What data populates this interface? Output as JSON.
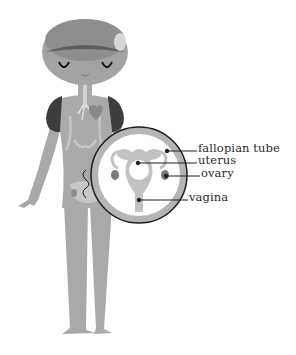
{
  "diagram": {
    "figure": "cartoon human figure with magnified inset of reproductive organs",
    "labels": [
      {
        "id": "fallopian_tube",
        "text": "fallopian tube"
      },
      {
        "id": "uterus",
        "text": "uterus"
      },
      {
        "id": "ovary",
        "text": "ovary"
      },
      {
        "id": "vagina",
        "text": "vagina"
      }
    ],
    "colors": {
      "body": "#a9a9a9",
      "body_light": "#c7c7c7",
      "head_dark": "#8e8e8e",
      "lungs": "#3d3d3d",
      "inset_ring": "#b5b5b5",
      "inset_bg": "#ffffff",
      "organ": "#c2c2c2",
      "ovary": "#7a7a7a",
      "line": "#1e1e1e"
    }
  }
}
